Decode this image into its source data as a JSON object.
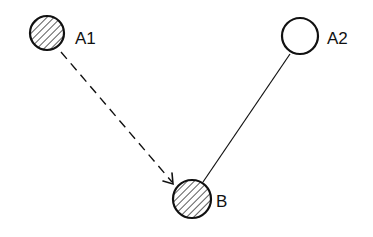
{
  "diagram": {
    "nodes": [
      {
        "id": "A1",
        "label": "A1",
        "cx": 47,
        "cy": 33,
        "r": 17,
        "fill": "hatched"
      },
      {
        "id": "A2",
        "label": "A2",
        "cx": 300,
        "cy": 36,
        "r": 18,
        "fill": "empty"
      },
      {
        "id": "B",
        "label": "B",
        "cx": 192,
        "cy": 199,
        "r": 19,
        "fill": "hatched"
      }
    ],
    "edges": [
      {
        "from": "A1",
        "to": "B",
        "style": "dashed",
        "arrow": true
      },
      {
        "from": "A2",
        "to": "B",
        "style": "solid",
        "arrow": false
      }
    ],
    "colors": {
      "stroke": "#111111",
      "background": "#ffffff",
      "hatch": "#333333"
    }
  }
}
